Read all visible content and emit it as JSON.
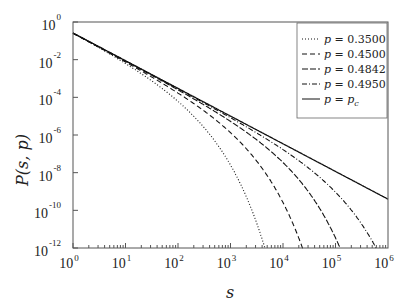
{
  "chart_data": {
    "type": "line",
    "title": "",
    "xlabel": "s",
    "ylabel": "P(s, p)",
    "xscale": "log",
    "yscale": "log",
    "xlim": [
      1,
      1000000
    ],
    "ylim": [
      1e-12,
      1
    ],
    "grid": false,
    "legend_position": "upper right",
    "x_ticks": [
      {
        "base": "10",
        "exp": "0"
      },
      {
        "base": "10",
        "exp": "1"
      },
      {
        "base": "10",
        "exp": "2"
      },
      {
        "base": "10",
        "exp": "3"
      },
      {
        "base": "10",
        "exp": "4"
      },
      {
        "base": "10",
        "exp": "5"
      },
      {
        "base": "10",
        "exp": "6"
      }
    ],
    "y_ticks": [
      {
        "base": "10",
        "exp": "0"
      },
      {
        "base": "10",
        "exp": "-2"
      },
      {
        "base": "10",
        "exp": "-4"
      },
      {
        "base": "10",
        "exp": "-6"
      },
      {
        "base": "10",
        "exp": "-8"
      },
      {
        "base": "10",
        "exp": "-10"
      },
      {
        "base": "10",
        "exp": "-12"
      }
    ],
    "series": [
      {
        "name": "p = 0.3500",
        "p_label": "0.3500",
        "style": "dotted",
        "cutoff_s": 200,
        "amp": 0.3
      },
      {
        "name": "p = 0.4500",
        "p_label": "0.4500",
        "style": "dashed",
        "cutoff_s": 1500,
        "amp": 0.26
      },
      {
        "name": "p = 0.4842",
        "p_label": "0.4842",
        "style": "longdash",
        "cutoff_s": 12000,
        "amp": 0.26
      },
      {
        "name": "p = 0.4950",
        "p_label": "0.4950",
        "style": "dashdot",
        "cutoff_s": 100000,
        "amp": 0.26
      },
      {
        "name": "p = p_c",
        "p_label": "p_c",
        "style": "solid",
        "cutoff_s": null,
        "amp": 0.26
      }
    ],
    "power_law_exponent": -1.47
  }
}
